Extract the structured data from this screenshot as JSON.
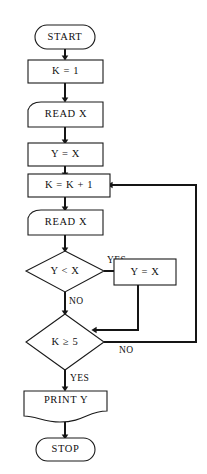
{
  "diagram": {
    "type": "flowchart",
    "colors": {
      "background": "#ffffff",
      "stroke": "#1a1a1a",
      "text": "#101010",
      "edge": "#151515"
    },
    "nodes": [
      {
        "id": "start",
        "label": "START",
        "shape": "terminator"
      },
      {
        "id": "init_k",
        "label": "K = 1",
        "shape": "process"
      },
      {
        "id": "read_x1",
        "label": "READ X",
        "shape": "input"
      },
      {
        "id": "assign_y",
        "label": "Y = X",
        "shape": "process"
      },
      {
        "id": "incr_k",
        "label": "K = K + 1",
        "shape": "process"
      },
      {
        "id": "read_x2",
        "label": "READ X",
        "shape": "input"
      },
      {
        "id": "cmp_y_x",
        "label": "Y < X",
        "shape": "decision"
      },
      {
        "id": "update_y",
        "label": "Y = X",
        "shape": "process"
      },
      {
        "id": "cmp_k_5",
        "label": "K ≥ 5",
        "shape": "decision"
      },
      {
        "id": "print_y",
        "label": "PRINT Y",
        "shape": "document"
      },
      {
        "id": "stop",
        "label": "STOP",
        "shape": "terminator"
      }
    ],
    "edge_labels": {
      "cmp_y_x_yes": "YES",
      "cmp_y_x_no": "NO",
      "cmp_k_5_no": "NO",
      "cmp_k_5_yes": "YES"
    },
    "edges": [
      {
        "from": "start",
        "to": "init_k",
        "label": ""
      },
      {
        "from": "init_k",
        "to": "read_x1",
        "label": ""
      },
      {
        "from": "read_x1",
        "to": "assign_y",
        "label": ""
      },
      {
        "from": "assign_y",
        "to": "incr_k",
        "label": ""
      },
      {
        "from": "incr_k",
        "to": "read_x2",
        "label": ""
      },
      {
        "from": "read_x2",
        "to": "cmp_y_x",
        "label": ""
      },
      {
        "from": "cmp_y_x",
        "to": "update_y",
        "label": "YES"
      },
      {
        "from": "cmp_y_x",
        "to": "cmp_k_5",
        "label": "NO"
      },
      {
        "from": "update_y",
        "to": "cmp_k_5",
        "label": ""
      },
      {
        "from": "cmp_k_5",
        "to": "incr_k",
        "label": "NO"
      },
      {
        "from": "cmp_k_5",
        "to": "print_y",
        "label": "YES"
      },
      {
        "from": "print_y",
        "to": "stop",
        "label": ""
      }
    ]
  }
}
